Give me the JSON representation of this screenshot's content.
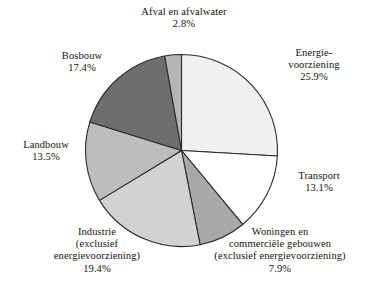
{
  "chart_data": {
    "type": "pie",
    "title": "",
    "subtitle": "",
    "xlabel": "",
    "ylabel": "",
    "legend_position": "none",
    "grid": false,
    "value_unit": "%",
    "start_angle_deg": 0,
    "direction": "clockwise",
    "categories": [
      "Energievoorziening",
      "Transport",
      "Woningen en commerciële gebouwen (exclusief energievoorziening)",
      "Industrie (exclusief energievoorziening)",
      "Landbouw",
      "Bosbouw",
      "Afval en afvalwater"
    ],
    "values": [
      25.9,
      13.1,
      7.9,
      19.4,
      13.5,
      17.4,
      2.8
    ],
    "colors": [
      "#f0f0f0",
      "#ffffff",
      "#a8a8a8",
      "#d2d2d2",
      "#bdbdbd",
      "#6e6e6e",
      "#b5b5b5"
    ],
    "slices": [
      {
        "label": "Energievoorziening",
        "value": 25.9,
        "value_text": "25.9%",
        "color": "#f0f0f0",
        "label_lines": [
          "Energie-",
          "voorziening",
          "25.9%"
        ]
      },
      {
        "label": "Transport",
        "value": 13.1,
        "value_text": "13.1%",
        "color": "#ffffff",
        "label_lines": [
          "Transport",
          "13.1%"
        ]
      },
      {
        "label": "Woningen en commerciële gebouwen (exclusief energievoorziening)",
        "value": 7.9,
        "value_text": "7.9%",
        "color": "#a8a8a8",
        "label_lines": [
          "Woningen en",
          "commerciële gebouwen",
          "(exclusief energievoorziening)",
          "7.9%"
        ]
      },
      {
        "label": "Industrie (exclusief energievoorziening)",
        "value": 19.4,
        "value_text": "19.4%",
        "color": "#d2d2d2",
        "label_lines": [
          "Industrie",
          "(exclusief",
          "energievoorziening)",
          "19.4%"
        ]
      },
      {
        "label": "Landbouw",
        "value": 13.5,
        "value_text": "13.5%",
        "color": "#bdbdbd",
        "label_lines": [
          "Landbouw",
          "13.5%"
        ]
      },
      {
        "label": "Bosbouw",
        "value": 17.4,
        "value_text": "17.4%",
        "color": "#6e6e6e",
        "label_lines": [
          "Bosbouw",
          "17.4%"
        ]
      },
      {
        "label": "Afval en afvalwater",
        "value": 2.8,
        "value_text": "2.8%",
        "color": "#b5b5b5",
        "label_lines": [
          "Afval en afvalwater",
          "2.8%"
        ]
      }
    ]
  },
  "labels": {
    "afval": {
      "l0": "Afval en afvalwater",
      "l1": "2.8%"
    },
    "energie": {
      "l0": "Energie-",
      "l1": "voorziening",
      "l2": "25.9%"
    },
    "transport": {
      "l0": "Transport",
      "l1": "13.1%"
    },
    "woningen": {
      "l0": "Woningen en",
      "l1": "commerciële gebouwen",
      "l2": "(exclusief energievoorziening)",
      "l3": "7.9%"
    },
    "industrie": {
      "l0": "Industrie",
      "l1": "(exclusief",
      "l2": "energievoorziening)",
      "l3": "19.4%"
    },
    "landbouw": {
      "l0": "Landbouw",
      "l1": "13.5%"
    },
    "bosbouw": {
      "l0": "Bosbouw",
      "l1": "17.4%"
    }
  }
}
